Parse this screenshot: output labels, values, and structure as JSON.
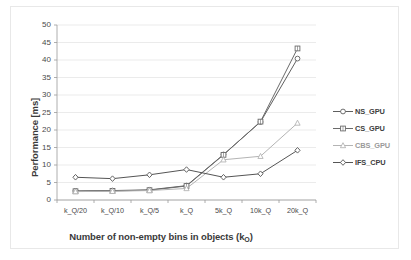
{
  "chart_data": {
    "type": "line",
    "title": "",
    "xlabel": "Number of non-empty bins in objects (k_O)",
    "xlabel_main": "Number of non-empty bins in objects (k",
    "xlabel_sub": "O",
    "xlabel_tail": ")",
    "ylabel": "Performance [ms]",
    "categories": [
      "k_Q/20",
      "k_Q/10",
      "k_Q/5",
      "k_Q",
      "5k_Q",
      "10k_Q",
      "20k_Q"
    ],
    "yticks": [
      0,
      5,
      10,
      15,
      20,
      25,
      30,
      35,
      40,
      45,
      50
    ],
    "ylim": [
      0,
      50
    ],
    "grid": true,
    "legend_position": "right",
    "series": [
      {
        "name": "NS_GPU",
        "marker": "circle",
        "color": "#5f5f5f",
        "values": [
          2.6,
          2.7,
          2.9,
          4.1,
          13.0,
          22.3,
          40.4
        ]
      },
      {
        "name": "CS_GPU",
        "marker": "square",
        "color": "#6b6b6b",
        "values": [
          2.5,
          2.6,
          2.8,
          4.0,
          12.9,
          22.4,
          43.3
        ]
      },
      {
        "name": "CBS_GPU",
        "marker": "triangle",
        "color": "#b4b4b4",
        "values": [
          2.4,
          2.5,
          2.7,
          3.3,
          11.5,
          12.5,
          22.0
        ]
      },
      {
        "name": "IFS_CPU",
        "marker": "diamond",
        "color": "#555555",
        "values": [
          6.5,
          6.1,
          7.2,
          8.7,
          6.5,
          7.5,
          14.2
        ]
      }
    ]
  }
}
